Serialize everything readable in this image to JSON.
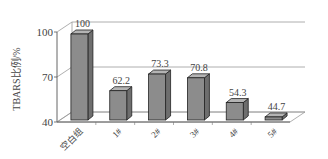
{
  "chart_data": {
    "type": "bar",
    "style": "3d",
    "title": "",
    "xlabel": "",
    "ylabel": "TBARS比例/%",
    "categories": [
      "空白组",
      "1#",
      "2#",
      "3#",
      "4#",
      "5#"
    ],
    "values": [
      100,
      62.2,
      73.3,
      70.8,
      54.3,
      44.7
    ],
    "data_labels": [
      "100",
      "62.2",
      "73.3",
      "70.8",
      "54.3",
      "44.7"
    ],
    "ylim": [
      40,
      100
    ],
    "yticks": [
      40,
      70,
      100
    ],
    "ytick_labels": [
      "40",
      "70",
      "100"
    ],
    "grid": true,
    "legend": null,
    "colors": {
      "bar_front": "#8c8c8c",
      "bar_side": "#6e6e6e",
      "bar_top": "#b4b4b4",
      "edge": "#222222",
      "grid": "#9a9a9a"
    }
  }
}
